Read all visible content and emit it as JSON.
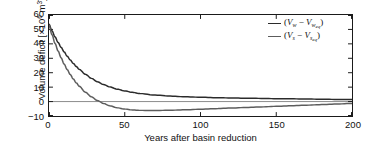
{
  "chart_data": {
    "type": "line",
    "title": "",
    "xlabel": "Years after basin reduction",
    "ylabel": "Volume deficit [×10⁶ m³]",
    "ylabel_parts": {
      "prefix": "Volume deficit [×10",
      "exponent": "6",
      "suffix": " m",
      "unit_exponent": "3",
      "close": "]"
    },
    "xlim": [
      0,
      200
    ],
    "ylim": [
      -10,
      60
    ],
    "xticks": [
      0,
      50,
      100,
      150,
      200
    ],
    "xtick_labels": [
      "0",
      "50",
      "100",
      "150",
      "200"
    ],
    "yticks": [
      -10,
      0,
      10,
      20,
      30,
      40,
      50,
      60
    ],
    "ytick_labels": [
      "−10",
      "0",
      "10",
      "20",
      "30",
      "40",
      "50",
      "60"
    ],
    "grid": false,
    "zero_line": true,
    "legend_position": "upper right",
    "tick_direction": "in",
    "series": [
      {
        "name": "(V_w − V_w,eq)",
        "color": "#2b2b2b",
        "x": [
          0,
          2,
          4,
          6,
          8,
          10,
          12,
          14,
          16,
          18,
          20,
          24,
          28,
          32,
          36,
          40,
          45,
          50,
          55,
          60,
          70,
          80,
          90,
          100,
          110,
          120,
          130,
          140,
          150,
          160,
          170,
          180,
          190,
          200
        ],
        "values": [
          53.5,
          49.0,
          44.8,
          41.0,
          37.6,
          34.4,
          31.5,
          28.9,
          26.5,
          24.3,
          22.3,
          18.9,
          16.1,
          13.7,
          11.8,
          10.2,
          8.6,
          7.4,
          6.4,
          5.6,
          4.5,
          3.8,
          3.3,
          3.0,
          2.7,
          2.5,
          2.3,
          2.2,
          2.0,
          1.9,
          1.8,
          1.6,
          1.5,
          1.4
        ]
      },
      {
        "name": "(V_s − V_s,eq)",
        "color": "#5c5c5c",
        "x": [
          0,
          2,
          4,
          6,
          8,
          10,
          12,
          14,
          16,
          18,
          20,
          24,
          28,
          32,
          36,
          40,
          45,
          50,
          55,
          60,
          70,
          80,
          90,
          100,
          110,
          120,
          130,
          140,
          150,
          160,
          170,
          180,
          190,
          200
        ],
        "values": [
          53.0,
          46.3,
          40.3,
          35.0,
          30.3,
          26.0,
          22.2,
          18.8,
          15.7,
          13.0,
          10.6,
          6.5,
          3.3,
          0.7,
          -1.3,
          -2.9,
          -4.3,
          -5.2,
          -5.8,
          -6.1,
          -6.2,
          -6.0,
          -5.7,
          -5.3,
          -4.9,
          -4.5,
          -4.1,
          -3.7,
          -3.3,
          -2.9,
          -2.5,
          -2.1,
          -1.7,
          -1.3
        ]
      }
    ],
    "legend": [
      {
        "open": "(",
        "v1": "V",
        "sub1": "w",
        "minus": " − ",
        "v2": "V",
        "sub2": "w",
        "sub2b": "eq",
        "close": ")"
      },
      {
        "open": "(",
        "v1": "V",
        "sub1": "s",
        "minus": " − ",
        "v2": "V",
        "sub2": "s",
        "sub2b": "eq",
        "close": ")"
      }
    ]
  }
}
